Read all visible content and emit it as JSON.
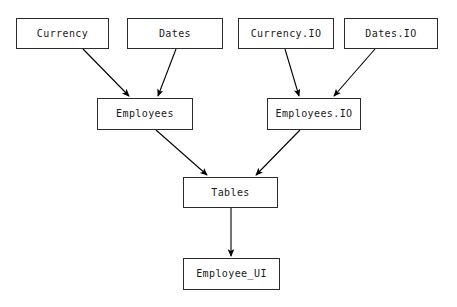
{
  "diagram": {
    "type": "dependency-graph",
    "background_color": "#ffffff",
    "edge_color": "#000000",
    "node_border_color": "#2b2b2b",
    "node_fill_color": "#ffffff",
    "text_color": "#1a1a1a",
    "nodes": [
      {
        "id": "currency",
        "label": "Currency",
        "x": 16,
        "y": 18,
        "w": 93,
        "h": 31
      },
      {
        "id": "dates",
        "label": "Dates",
        "x": 127,
        "y": 18,
        "w": 96,
        "h": 31
      },
      {
        "id": "currency_io",
        "label": "Currency.IO",
        "x": 238,
        "y": 18,
        "w": 96,
        "h": 31
      },
      {
        "id": "dates_io",
        "label": "Dates.IO",
        "x": 344,
        "y": 18,
        "w": 94,
        "h": 31
      },
      {
        "id": "employees",
        "label": "Employees",
        "x": 97,
        "y": 98,
        "w": 96,
        "h": 32
      },
      {
        "id": "employees_io",
        "label": "Employees.IO",
        "x": 267,
        "y": 98,
        "w": 94,
        "h": 32
      },
      {
        "id": "tables",
        "label": "Tables",
        "x": 183,
        "y": 177,
        "w": 95,
        "h": 31
      },
      {
        "id": "employee_ui",
        "label": "Employee_UI",
        "x": 183,
        "y": 258,
        "w": 97,
        "h": 32
      }
    ],
    "edges": [
      {
        "id": "currency-to-employees",
        "from": "Currency",
        "to": "Employees",
        "x1": 83,
        "y1": 49,
        "x2": 129,
        "y2": 96
      },
      {
        "id": "dates-to-employees",
        "from": "Dates",
        "to": "Employees",
        "x1": 176,
        "y1": 49,
        "x2": 158,
        "y2": 96
      },
      {
        "id": "currencyio-to-employeesio",
        "from": "Currency.IO",
        "to": "Employees.IO",
        "x1": 285,
        "y1": 49,
        "x2": 299,
        "y2": 96
      },
      {
        "id": "datesio-to-employeesio",
        "from": "Dates.IO",
        "to": "Employees.IO",
        "x1": 375,
        "y1": 49,
        "x2": 334,
        "y2": 96
      },
      {
        "id": "employees-to-tables",
        "from": "Employees",
        "to": "Tables",
        "x1": 156,
        "y1": 130,
        "x2": 207,
        "y2": 175
      },
      {
        "id": "employeesio-to-tables",
        "from": "Employees.IO",
        "to": "Tables",
        "x1": 300,
        "y1": 130,
        "x2": 256,
        "y2": 175
      },
      {
        "id": "tables-to-employeeui",
        "from": "Tables",
        "to": "Employee_UI",
        "x1": 231,
        "y1": 208,
        "x2": 231,
        "y2": 256
      }
    ]
  }
}
